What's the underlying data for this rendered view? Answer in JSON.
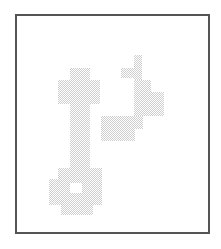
{
  "image": {
    "description": "Dithered gray pixel-art icons inside a framed panel",
    "frame_color": "#555555",
    "dither_color": "#cfcfcf",
    "background": "#ffffff",
    "icons": [
      {
        "name": "key",
        "label": "key"
      },
      {
        "name": "music-note",
        "label": "music note"
      }
    ]
  }
}
